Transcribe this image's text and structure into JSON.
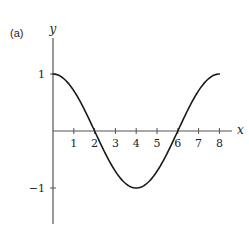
{
  "panel_label": "(a)",
  "chart_data": {
    "type": "line",
    "title": "",
    "function": "y = cos(pi*x/4)",
    "xlabel": "x",
    "ylabel": "y",
    "xlim": [
      0,
      8.6
    ],
    "ylim": [
      -1.75,
      1.6
    ],
    "x_ticks": [
      1,
      2,
      3,
      4,
      5,
      6,
      7,
      8
    ],
    "x_tick_labels": [
      "1",
      "2",
      "3",
      "4",
      "5",
      "6",
      "7",
      "8"
    ],
    "y_ticks": [
      1,
      -1
    ],
    "y_tick_labels": [
      "1",
      "−1"
    ],
    "grid": false,
    "legend": null,
    "series": [
      {
        "name": "curve",
        "x": [
          0,
          0.5,
          1,
          1.5,
          2,
          2.5,
          3,
          3.5,
          4,
          4.5,
          5,
          5.5,
          6,
          6.5,
          7,
          7.5,
          8
        ],
        "y": [
          1,
          0.92,
          0.71,
          0.38,
          0,
          -0.38,
          -0.71,
          -0.92,
          -1,
          -0.92,
          -0.71,
          -0.38,
          0,
          0.38,
          0.71,
          0.92,
          1
        ]
      }
    ],
    "key_points": {
      "max_start": [
        0,
        1
      ],
      "zero_1": [
        2,
        0
      ],
      "min": [
        4,
        -1
      ],
      "zero_2": [
        6,
        0
      ],
      "max_end": [
        8,
        1
      ]
    },
    "colors": {
      "axis": "#555555",
      "curve": "#1a1a1a"
    }
  }
}
